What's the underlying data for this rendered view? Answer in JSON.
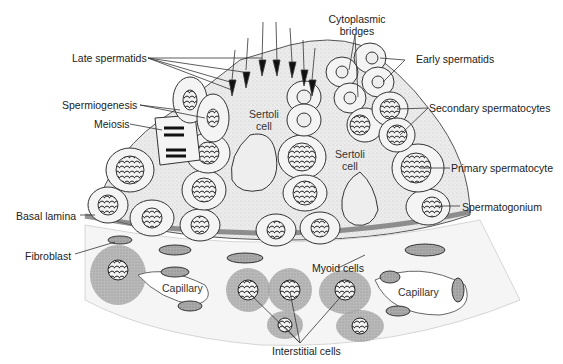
{
  "diagram": {
    "labels": {
      "late_spermatids": "Late spermatids",
      "spermiogenesis": "Spermiogenesis",
      "meiosis": "Meiosis",
      "cytoplasmic_bridges_1": "Cytoplasmic",
      "cytoplasmic_bridges_2": "bridges",
      "early_spermatids": "Early spermatids",
      "secondary_spermatocytes": "Secondary spermatocytes",
      "primary_spermatocyte": "Primary spermatocyte",
      "spermatogonium": "Spermatogonium",
      "basal_lamina": "Basal lamina",
      "fibroblast": "Fibroblast",
      "myoid_cells": "Myoid cells",
      "capillary_left": "Capillary",
      "capillary_right": "Capillary",
      "interstitial_cells": "Interstitial cells",
      "sertoli_left_1": "Sertoli",
      "sertoli_left_2": "cell",
      "sertoli_right_1": "Sertoli",
      "sertoli_right_2": "cell"
    },
    "colors": {
      "line": "#333333",
      "cytoplasm": "#e9e9e9",
      "nucleus_dark": "#2a2a2a",
      "interstitial": "#9a9a9a",
      "background": "#ffffff"
    }
  }
}
